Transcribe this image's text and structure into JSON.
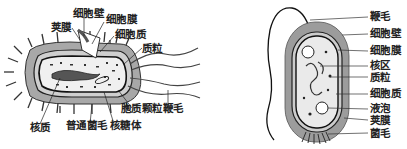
{
  "left_figure": {
    "description": "Generalized bacterial cell structure (rod-shaped, cutaway)",
    "labels": {
      "capsule": "荚膜",
      "cell_wall": "细胞壁",
      "cell_membrane": "细胞膜",
      "cytoplasm": "细胞质",
      "plasmid": "质粒",
      "cytoplasmic_granules": "胞质颗粒",
      "flagellum": "鞭毛",
      "nucleoid": "核质",
      "common_pili": "普通菌毛",
      "ribosome": "核糖体"
    }
  },
  "right_figure": {
    "description": "Bacterial cell structure (longitudinal section)",
    "labels": [
      "鞭毛",
      "细胞壁",
      "细胞膜",
      "核区",
      "质粒",
      "细胞质",
      "液泡",
      "荚膜",
      "菌毛"
    ]
  },
  "colors": {
    "ink": "#222222",
    "background": "#ffffff",
    "capsule_gray": "#9a9a9a",
    "cytoplasm_light": "#eeeeee"
  }
}
